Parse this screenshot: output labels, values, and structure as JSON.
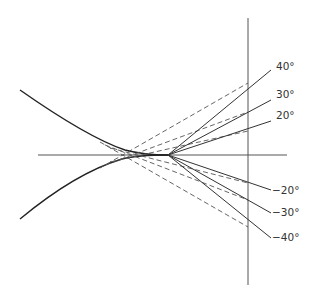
{
  "diagram": {
    "labels": {
      "p40": "40°",
      "p30": "30°",
      "p20": "20°",
      "m20": "−20°",
      "m30": "−30°",
      "m40": "−40°"
    },
    "geometry": {
      "horizontal_axis": {
        "x1": 38,
        "x2": 287,
        "y": 155
      },
      "vertical_line": {
        "x": 248,
        "y1": 18,
        "y2": 285
      },
      "solid_origin": {
        "x": 168,
        "y": 155
      },
      "dashed_origin": {
        "x": 132,
        "y": 155
      },
      "angles_deg": [
        40,
        30,
        20,
        -20,
        -30,
        -40
      ]
    },
    "colors": {
      "line": "#333333",
      "axis": "#555555",
      "background": "#ffffff"
    }
  }
}
